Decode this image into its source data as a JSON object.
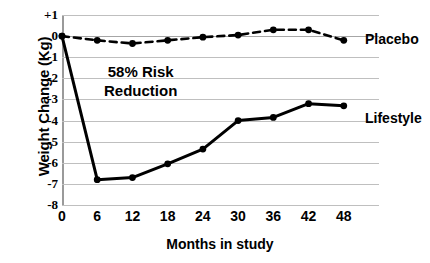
{
  "chart_data": {
    "type": "line",
    "title": "",
    "xlabel": "Months in study",
    "ylabel": "Weight Change (Kg)",
    "x": [
      0,
      6,
      12,
      18,
      24,
      30,
      36,
      42,
      48
    ],
    "xlim": [
      0,
      54
    ],
    "ylim": [
      -8,
      1
    ],
    "xticks": [
      "0",
      "6",
      "12",
      "18",
      "24",
      "30",
      "36",
      "42",
      "48"
    ],
    "yticks": [
      "+1",
      "0",
      "-1",
      "-2",
      "-3",
      "-4",
      "-5",
      "-6",
      "-7",
      "-8"
    ],
    "ytick_values": [
      1,
      0,
      -1,
      -2,
      -3,
      -4,
      -5,
      -6,
      -7,
      -8
    ],
    "grid": true,
    "legend_position": "right-inline",
    "series": [
      {
        "name": "Placebo",
        "style": "dashed",
        "color": "#000000",
        "marker": "circle",
        "x": [
          0,
          6,
          12,
          18,
          24,
          30,
          36,
          42,
          48
        ],
        "values": [
          0.0,
          -0.2,
          -0.35,
          -0.2,
          -0.05,
          0.05,
          0.3,
          0.3,
          -0.2
        ]
      },
      {
        "name": "Lifestyle",
        "style": "solid",
        "color": "#000000",
        "marker": "circle",
        "x": [
          0,
          6,
          12,
          18,
          24,
          30,
          36,
          42,
          48
        ],
        "values": [
          0.0,
          -6.8,
          -6.7,
          -6.05,
          -5.35,
          -4.0,
          -3.85,
          -3.2,
          -3.3
        ]
      }
    ],
    "annotations": [
      {
        "text_line_1": "58% Risk",
        "text_line_2": "Reduction",
        "x": 15,
        "y": -2.0
      }
    ]
  },
  "axis": {
    "y_title": "Weight Change (Kg)",
    "x_title": "Months in study"
  },
  "annotation": {
    "line1": "58% Risk",
    "line2": "Reduction"
  },
  "legend": {
    "placebo": "Placebo",
    "lifestyle": "Lifestyle"
  }
}
